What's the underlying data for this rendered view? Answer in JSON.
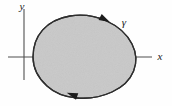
{
  "figure": {
    "kind": "oriented-closed-curve-diagram",
    "background_color": "#fefefe",
    "region": {
      "name": "shaded-region",
      "fill_color": "#c9c9c9",
      "outline_color": "#2e2e2e",
      "outline_width": 1.3
    },
    "axes": {
      "color": "#4f4f4f",
      "origin": {
        "x": 24,
        "y": 57
      },
      "x_axis": {
        "label": "x",
        "label_position": {
          "x": 160,
          "y": 60
        },
        "start": {
          "x": 8,
          "y": 57
        },
        "end": {
          "x": 152,
          "y": 57
        }
      },
      "y_axis": {
        "label": "y",
        "label_position": {
          "x": 22,
          "y": 10
        },
        "start": {
          "x": 24,
          "y": 9
        },
        "end": {
          "x": 24,
          "y": 80
        }
      }
    },
    "curve": {
      "label": "γ",
      "label_position": {
        "x": 124,
        "y": 26
      },
      "orientation": "clockwise",
      "arrow_markers": [
        {
          "name": "top-arrow",
          "x": 104,
          "y": 19,
          "angle_deg": 28
        },
        {
          "name": "bottom-arrow",
          "x": 73,
          "y": 95,
          "angle_deg": 200
        }
      ],
      "path": "M 33 57 C 33 36, 46 20, 70 16 C 95 12, 122 24, 132 44 C 141 62, 134 82, 112 92 C 90 102, 62 100, 47 86 C 37 77, 33 68, 33 57 Z"
    }
  }
}
